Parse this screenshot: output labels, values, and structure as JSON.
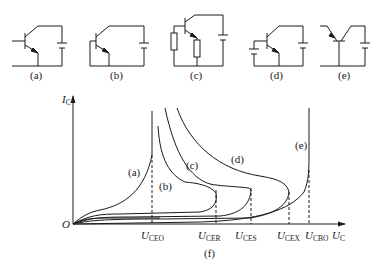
{
  "circuits": [
    {
      "id": "a",
      "label": "(a)",
      "description": "base open"
    },
    {
      "id": "b",
      "label": "(b)",
      "description": "base shorted to emitter"
    },
    {
      "id": "c",
      "label": "(c)",
      "description": "base-emitter resistor"
    },
    {
      "id": "d",
      "label": "(d)",
      "description": "reverse bias on base"
    },
    {
      "id": "e",
      "label": "(e)",
      "description": "collector-base, emitter open"
    }
  ],
  "graph": {
    "caption": "(f)",
    "y_axis": {
      "symbol": "I",
      "sub": "C"
    },
    "x_axis": {
      "symbol": "U",
      "sub": "C"
    },
    "origin": "O",
    "curve_labels": [
      "(a)",
      "(b)",
      "(c)",
      "(d)",
      "(e)"
    ],
    "x_ticks": [
      {
        "symbol": "U",
        "sub": "CEO"
      },
      {
        "symbol": "U",
        "sub": "CER"
      },
      {
        "symbol": "U",
        "sub": "CES"
      },
      {
        "symbol": "U",
        "sub": "CEX"
      },
      {
        "symbol": "U",
        "sub": "CBO"
      }
    ]
  },
  "colors": {
    "line": "#1a1a1a",
    "background": "#ffffff"
  }
}
